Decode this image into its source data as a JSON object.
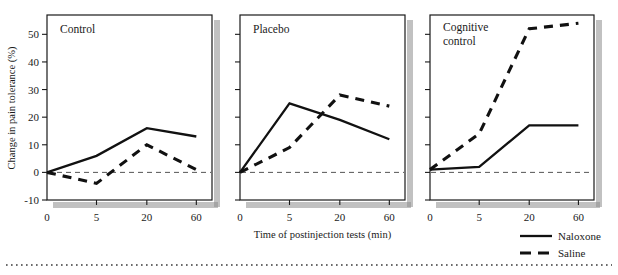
{
  "figure": {
    "axis_title_x": "Time of postinjection tests (min)",
    "axis_title_y": "Change in pain tolerance (%)",
    "y_ticks": [
      "-10",
      "0",
      "10",
      "20",
      "30",
      "40",
      "50"
    ],
    "x_ticks": [
      "0",
      "5",
      "20",
      "60"
    ],
    "panel_titles": [
      "Control",
      "Placebo",
      "Cognitive",
      "control"
    ],
    "legend": [
      {
        "label": "Naloxone",
        "style": "solid"
      },
      {
        "label": "Saline",
        "style": "dashed"
      }
    ],
    "colors": {
      "line": "#111111",
      "axis": "#1a1a1a",
      "zero_line": "#555555",
      "shadow": "#8e8e8e",
      "dotted_rule": "#6b6b6b"
    }
  },
  "chart_data": [
    {
      "type": "line",
      "title": "Control",
      "xlabel": "Time of postinjection tests (min)",
      "ylabel": "Change in pain tolerance (%)",
      "categories": [
        "0",
        "5",
        "20",
        "60"
      ],
      "x": [
        0,
        5,
        20,
        60
      ],
      "ylim": [
        -10,
        57
      ],
      "yticks": [
        -10,
        0,
        10,
        20,
        30,
        40,
        50
      ],
      "grid": false,
      "zero_reference_line": 0,
      "series": [
        {
          "name": "Naloxone",
          "style": "solid",
          "values": [
            0,
            6,
            16,
            13
          ]
        },
        {
          "name": "Saline",
          "style": "dashed",
          "values": [
            0,
            -4,
            10,
            1
          ]
        }
      ]
    },
    {
      "type": "line",
      "title": "Placebo",
      "xlabel": "Time of postinjection tests (min)",
      "ylabel": "Change in pain tolerance (%)",
      "categories": [
        "0",
        "5",
        "20",
        "60"
      ],
      "x": [
        0,
        5,
        20,
        60
      ],
      "ylim": [
        -10,
        57
      ],
      "yticks": [
        -10,
        0,
        10,
        20,
        30,
        40,
        50
      ],
      "grid": false,
      "zero_reference_line": 0,
      "series": [
        {
          "name": "Naloxone",
          "style": "solid",
          "values": [
            0,
            25,
            19,
            12
          ]
        },
        {
          "name": "Saline",
          "style": "dashed",
          "values": [
            0,
            9,
            28,
            24
          ]
        }
      ]
    },
    {
      "type": "line",
      "title": "Cognitive control",
      "xlabel": "Time of postinjection tests (min)",
      "ylabel": "Change in pain tolerance (%)",
      "categories": [
        "0",
        "5",
        "20",
        "60"
      ],
      "x": [
        0,
        5,
        20,
        60
      ],
      "ylim": [
        -10,
        57
      ],
      "yticks": [
        -10,
        0,
        10,
        20,
        30,
        40,
        50
      ],
      "grid": false,
      "zero_reference_line": 0,
      "series": [
        {
          "name": "Naloxone",
          "style": "solid",
          "values": [
            1,
            2,
            17,
            17
          ]
        },
        {
          "name": "Saline",
          "style": "dashed",
          "values": [
            1,
            14,
            52,
            54
          ]
        }
      ]
    }
  ]
}
